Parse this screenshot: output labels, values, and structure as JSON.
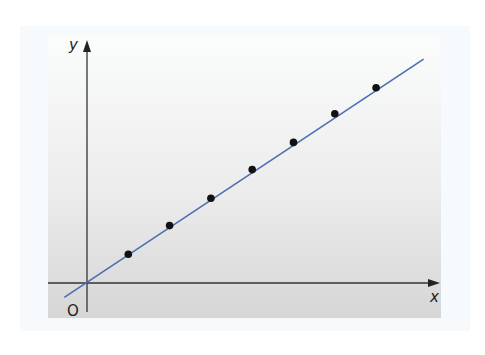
{
  "chart_data": {
    "type": "scatter",
    "title": "",
    "xlabel": "x",
    "ylabel": "y",
    "origin_label": "O",
    "grid": false,
    "legend": null,
    "series": [
      {
        "name": "data points",
        "kind": "scatter",
        "color": "#111111",
        "points": [
          {
            "x": 1,
            "y": 1.0
          },
          {
            "x": 2,
            "y": 2.0
          },
          {
            "x": 3,
            "y": 2.95
          },
          {
            "x": 4,
            "y": 3.95
          },
          {
            "x": 5,
            "y": 4.9
          },
          {
            "x": 6,
            "y": 5.9
          },
          {
            "x": 7,
            "y": 6.8
          }
        ]
      },
      {
        "name": "line of best fit",
        "kind": "line",
        "color": "#4a6fb0",
        "points": [
          {
            "x": -0.55,
            "y": -0.5
          },
          {
            "x": 8.15,
            "y": 7.8
          }
        ]
      }
    ],
    "xlim": [
      -1,
      9
    ],
    "ylim": [
      -1,
      8.5
    ]
  },
  "labels": {
    "x_axis": "x",
    "y_axis": "y",
    "origin": "O"
  },
  "colors": {
    "line": "#4a6fb0",
    "points": "#111111",
    "axes": "#333333"
  }
}
